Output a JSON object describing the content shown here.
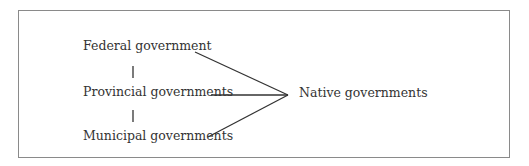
{
  "diagram": {
    "nodes": {
      "federal": "Federal government",
      "provincial": "Provincial governments",
      "municipal": "Municipal governments",
      "native": "Native governments"
    },
    "edges": [
      {
        "from": "federal",
        "to": "provincial",
        "style": "vertical-tick"
      },
      {
        "from": "provincial",
        "to": "municipal",
        "style": "vertical-tick"
      },
      {
        "from": "federal",
        "to": "native",
        "style": "line"
      },
      {
        "from": "provincial",
        "to": "native",
        "style": "line"
      },
      {
        "from": "municipal",
        "to": "native",
        "style": "line"
      }
    ],
    "colors": {
      "line": "#333333",
      "border": "#8a8a8a",
      "text": "#333333"
    }
  }
}
